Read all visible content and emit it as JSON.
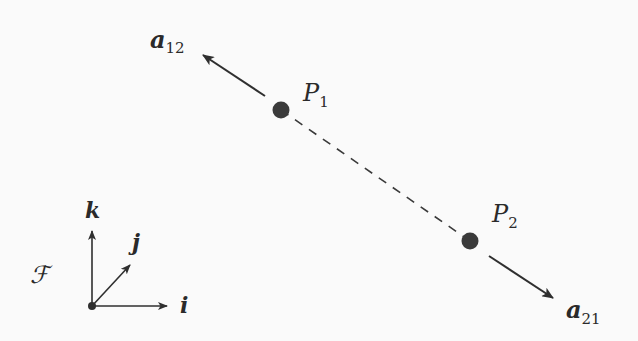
{
  "diagram": {
    "type": "two-particle-frame",
    "colors": {
      "ink": "#2f2f2f",
      "background": "#fafafa"
    },
    "points": [
      {
        "id": "P1",
        "label": "P",
        "subscript": "1",
        "x": 281,
        "y": 110
      },
      {
        "id": "P2",
        "label": "P",
        "subscript": "2",
        "x": 470,
        "y": 241
      }
    ],
    "connector": {
      "style": "dashed",
      "from": "P1",
      "to": "P2"
    },
    "vectors": [
      {
        "id": "a12",
        "label": "a",
        "subscript": "12",
        "from": [
          265,
          96
        ],
        "to": [
          203,
          55
        ]
      },
      {
        "id": "a21",
        "label": "a",
        "subscript": "21",
        "from": [
          489,
          256
        ],
        "to": [
          553,
          298
        ]
      }
    ],
    "frame": {
      "label": "ℱ",
      "origin": [
        92,
        306
      ],
      "axes": [
        {
          "id": "k",
          "label": "k",
          "to": [
            92,
            230
          ]
        },
        {
          "id": "j",
          "label": "j",
          "to": [
            131,
            264
          ]
        },
        {
          "id": "i",
          "label": "i",
          "to": [
            168,
            306
          ]
        }
      ]
    }
  }
}
